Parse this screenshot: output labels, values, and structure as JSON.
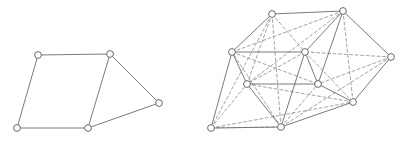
{
  "figure": {
    "width": 410,
    "height": 143,
    "background": "#ffffff",
    "caption": "",
    "stroke_color": "#6b6b6b",
    "dashed_stroke_color": "#8d8d8d",
    "node_stroke_color": "#5a5a5a",
    "node_fill_color": "#ffffff",
    "edge_width": 0.9,
    "dashed_edge_width": 0.8,
    "node_radius": 3.4,
    "node_stroke_width": 0.9,
    "dash_pattern": "3,2.5",
    "panels": [
      {
        "name": "left-graph",
        "label": "",
        "nodes": [
          {
            "id": "L1",
            "label": "",
            "x": 38,
            "y": 55
          },
          {
            "id": "L2",
            "label": "",
            "x": 110,
            "y": 54
          },
          {
            "id": "L3",
            "label": "",
            "x": 159,
            "y": 103
          },
          {
            "id": "L4",
            "label": "",
            "x": 88,
            "y": 128
          },
          {
            "id": "L5",
            "label": "",
            "x": 17,
            "y": 128
          }
        ],
        "solid_edges": [
          [
            "L1",
            "L2"
          ],
          [
            "L2",
            "L3"
          ],
          [
            "L3",
            "L4"
          ],
          [
            "L4",
            "L5"
          ],
          [
            "L5",
            "L1"
          ],
          [
            "L2",
            "L4"
          ]
        ],
        "dashed_edges": []
      },
      {
        "name": "right-graph",
        "label": "",
        "nodes": [
          {
            "id": "R1",
            "label": "",
            "x": 272,
            "y": 14
          },
          {
            "id": "R2",
            "label": "",
            "x": 343,
            "y": 11
          },
          {
            "id": "R3",
            "label": "",
            "x": 391,
            "y": 57
          },
          {
            "id": "R4",
            "label": "",
            "x": 353,
            "y": 102
          },
          {
            "id": "R5",
            "label": "",
            "x": 281,
            "y": 127
          },
          {
            "id": "R6",
            "label": "",
            "x": 211,
            "y": 128
          },
          {
            "id": "R7",
            "label": "",
            "x": 232,
            "y": 52
          },
          {
            "id": "R8",
            "label": "",
            "x": 305,
            "y": 52
          },
          {
            "id": "R9",
            "label": "",
            "x": 318,
            "y": 84
          },
          {
            "id": "R10",
            "label": "",
            "x": 247,
            "y": 84
          }
        ],
        "solid_edges": [
          [
            "R1",
            "R2"
          ],
          [
            "R2",
            "R3"
          ],
          [
            "R3",
            "R4"
          ],
          [
            "R4",
            "R5"
          ],
          [
            "R5",
            "R6"
          ],
          [
            "R1",
            "R7"
          ],
          [
            "R2",
            "R8"
          ],
          [
            "R7",
            "R8"
          ],
          [
            "R8",
            "R9"
          ],
          [
            "R9",
            "R10"
          ],
          [
            "R10",
            "R7"
          ],
          [
            "R7",
            "R6"
          ],
          [
            "R8",
            "R5"
          ],
          [
            "R9",
            "R4"
          ],
          [
            "R10",
            "R5"
          ],
          [
            "R2",
            "R9"
          ]
        ],
        "dashed_edges": [
          [
            "R1",
            "R8"
          ],
          [
            "R1",
            "R5"
          ],
          [
            "R1",
            "R10"
          ],
          [
            "R1",
            "R6"
          ],
          [
            "R2",
            "R7"
          ],
          [
            "R2",
            "R4"
          ],
          [
            "R2",
            "R10"
          ],
          [
            "R3",
            "R8"
          ],
          [
            "R3",
            "R9"
          ],
          [
            "R3",
            "R5"
          ],
          [
            "R4",
            "R8"
          ],
          [
            "R4",
            "R10"
          ],
          [
            "R5",
            "R9"
          ],
          [
            "R5",
            "R7"
          ],
          [
            "R6",
            "R10"
          ],
          [
            "R6",
            "R5"
          ],
          [
            "R7",
            "R9"
          ],
          [
            "R8",
            "R10"
          ],
          [
            "R6",
            "R4"
          ]
        ]
      }
    ]
  }
}
